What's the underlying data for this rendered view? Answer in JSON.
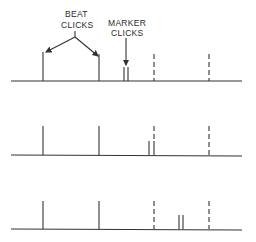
{
  "diagram": {
    "labels": {
      "beat_line1": "BEAT",
      "beat_line2": "CLICKS",
      "marker_line1": "MARKER",
      "marker_line2": "CLICKS"
    },
    "rows": [
      {
        "name": "row-1",
        "baseline_y": 81,
        "beat_clicks_x": [
          43,
          99
        ],
        "dashed_x": [
          154,
          209
        ],
        "marker_clicks_x": [
          124,
          128
        ]
      },
      {
        "name": "row-2",
        "baseline_y": 155,
        "beat_clicks_x": [
          43,
          99
        ],
        "dashed_x": [
          154,
          209
        ],
        "marker_clicks_x": [
          149,
          154
        ]
      },
      {
        "name": "row-3",
        "baseline_y": 229,
        "beat_clicks_x": [
          43,
          99
        ],
        "dashed_x": [
          154,
          209
        ],
        "marker_clicks_x": [
          179,
          183
        ]
      }
    ],
    "colors": {
      "ink": "#333333",
      "background": "#ffffff"
    }
  }
}
